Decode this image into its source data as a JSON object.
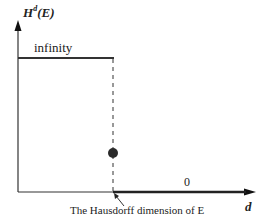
{
  "diagram": {
    "y_axis_label": {
      "main": "H",
      "superscript": "d",
      "argument": "(E)"
    },
    "x_axis_label": "d",
    "upper_value_label": "infinity",
    "lower_value_label": "0",
    "caption": "The Hausdorff dimension of E",
    "colors": {
      "line": "#333333",
      "dot": "#2a2a2a",
      "background": "#ffffff"
    }
  }
}
